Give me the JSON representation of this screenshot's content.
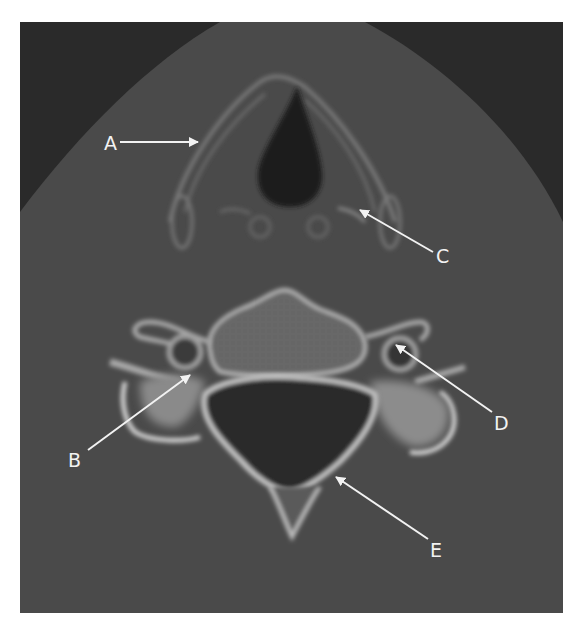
{
  "figure": {
    "type": "axial CT scan",
    "background_color": "#464646",
    "air_color": "#262626",
    "bone_color": "#c8c8c8",
    "annotation_color": "#f2f2f2"
  },
  "labels": [
    {
      "id": "A",
      "text": "A",
      "x": 107,
      "y": 134
    },
    {
      "id": "B",
      "text": "B",
      "x": 70,
      "y": 451
    },
    {
      "id": "C",
      "text": "C",
      "x": 437,
      "y": 247
    },
    {
      "id": "D",
      "text": "D",
      "x": 495,
      "y": 414
    },
    {
      "id": "E",
      "text": "E",
      "x": 432,
      "y": 541
    }
  ]
}
